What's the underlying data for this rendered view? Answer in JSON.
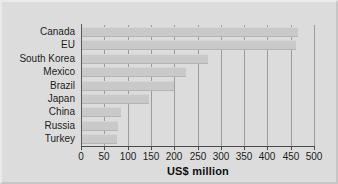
{
  "chart_data": {
    "type": "bar",
    "orientation": "horizontal",
    "title": "",
    "subtitle": "",
    "xlabel": "US$ million",
    "ylabel": "",
    "xlim": [
      0,
      500
    ],
    "xticks": [
      0,
      50,
      100,
      150,
      200,
      250,
      300,
      350,
      400,
      450,
      500
    ],
    "xticklabels": [
      "0",
      "50",
      "100",
      "150",
      "200",
      "250",
      "300",
      "350",
      "400",
      "450",
      "500"
    ],
    "grid": "vertical",
    "legend": null,
    "categories": [
      "Canada",
      "EU",
      "South Korea",
      "Mexico",
      "Brazil",
      "Japan",
      "China",
      "Russia",
      "Turkey"
    ],
    "values": [
      465,
      462,
      272,
      225,
      200,
      145,
      85,
      80,
      77
    ],
    "series": [
      {
        "name": "US$ million",
        "values": [
          465,
          462,
          272,
          225,
          200,
          145,
          85,
          80,
          77
        ]
      }
    ],
    "colors": {
      "bar_fill": "#c9c9c9",
      "background": "#dcdcdc",
      "gridline": "#9c9c9c",
      "axis": "#4a4a4a",
      "text": "#1c1c1c"
    }
  }
}
